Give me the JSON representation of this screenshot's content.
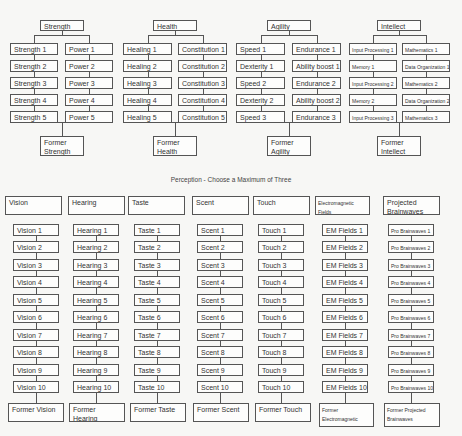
{
  "top_groups": [
    {
      "header": "Strength",
      "col1": [
        "Strength 1",
        "Strength 2",
        "Strength 3",
        "Strength 4",
        "Strength 5"
      ],
      "col2": [
        "Power 1",
        "Power 2",
        "Power 3",
        "Power 4",
        "Power 5"
      ],
      "former": "Former Strength",
      "layout": {
        "hx": 40,
        "hw": 44,
        "c1x": 10,
        "c2x": 65,
        "cw": 48,
        "small1": false,
        "small2": false
      }
    },
    {
      "header": "Health",
      "col1": [
        "Healing 1",
        "Healing 2",
        "Healing 3",
        "Healing 4",
        "Healing 5"
      ],
      "col2": [
        "Constitution 1",
        "Constitution 2",
        "Constitution 3",
        "Constitution 4",
        "Constitution 5"
      ],
      "former": "Former Health",
      "layout": {
        "hx": 153,
        "hw": 44,
        "c1x": 123,
        "c2x": 178,
        "cw": 49,
        "small1": false,
        "small2": false
      }
    },
    {
      "header": "Agility",
      "col1": [
        "Speed 1",
        "Dexterity 1",
        "Speed 2",
        "Dexterity 2",
        "Speed 3"
      ],
      "col2": [
        "Endurance 1",
        "Ability boost 1",
        "Endurance 2",
        "Ability boost 2",
        "Endurance 3"
      ],
      "former": "Former Agility",
      "layout": {
        "hx": 267,
        "hw": 44,
        "c1x": 236,
        "c2x": 292,
        "cw": 49,
        "small1": false,
        "small2": false
      }
    },
    {
      "header": "Intellect",
      "col1": [
        "Input Processing 1",
        "Memory 1",
        "Input Processing 2",
        "Memory 2",
        "Input Processing 3"
      ],
      "col2": [
        "Mathematics 1",
        "Data Organization 1",
        "Mathematics 2",
        "Data Organization 2",
        "Mathematics 3"
      ],
      "former": "Former Intellect",
      "layout": {
        "hx": 377,
        "hw": 44,
        "c1x": 349,
        "c2x": 402,
        "cw": 48,
        "small1": true,
        "small2": true
      }
    }
  ],
  "perception": {
    "title": "Perception - Choose a Maximum of Three",
    "columns": [
      {
        "header": "Vision",
        "items": [
          "Vision 1",
          "Vision 2",
          "Vision 3",
          "Vision 4",
          "Vision 5",
          "Vision 6",
          "Vision 7",
          "Vision 8",
          "Vision 9",
          "Vision 10"
        ],
        "former": "Former Vision",
        "layout": {
          "hx": 5,
          "hw": 57,
          "ix": 13,
          "iw": 46,
          "fx": 8,
          "fw": 56,
          "small": false
        }
      },
      {
        "header": "Hearing",
        "items": [
          "Hearing 1",
          "Hearing 2",
          "Hearing 3",
          "Hearing 4",
          "Hearing 5",
          "Hearing 6",
          "Hearing 7",
          "Hearing 8",
          "Hearing 9",
          "Hearing 10"
        ],
        "former": "Former Hearing",
        "layout": {
          "hx": 68,
          "hw": 57,
          "ix": 73,
          "iw": 46,
          "fx": 69,
          "fw": 56,
          "small": false
        }
      },
      {
        "header": "Taste",
        "items": [
          "Taste 1",
          "Taste 2",
          "Taste 3",
          "Taste 4",
          "Taste 5",
          "Taste 6",
          "Taste 7",
          "Taste 8",
          "Taste 9",
          "Taste 10"
        ],
        "former": "Former Taste",
        "layout": {
          "hx": 128,
          "hw": 57,
          "ix": 134,
          "iw": 46,
          "fx": 130,
          "fw": 56,
          "small": false
        }
      },
      {
        "header": "Scent",
        "items": [
          "Scent 1",
          "Scent 2",
          "Scent 3",
          "Scent 4",
          "Scent 5",
          "Scent 6",
          "Scent 7",
          "Scent 8",
          "Scent 9",
          "Scent 10"
        ],
        "former": "Former Scent",
        "layout": {
          "hx": 192,
          "hw": 57,
          "ix": 197,
          "iw": 46,
          "fx": 193,
          "fw": 56,
          "small": false
        }
      },
      {
        "header": "Touch",
        "items": [
          "Touch 1",
          "Touch 2",
          "Touch 3",
          "Touch 4",
          "Touch 5",
          "Touch 6",
          "Touch 7",
          "Touch 8",
          "Touch 9",
          "Touch 10"
        ],
        "former": "Former Touch",
        "layout": {
          "hx": 253,
          "hw": 57,
          "ix": 258,
          "iw": 46,
          "fx": 255,
          "fw": 56,
          "small": false
        }
      },
      {
        "header": "Electromagnetic Fields",
        "items": [
          "EM Fields 1",
          "EM Fields 2",
          "EM Fields 3",
          "EM Fields 4",
          "EM Fields 5",
          "EM Fields 6",
          "EM Fields 7",
          "EM Fields 8",
          "EM Fields 9",
          "EM Fields 10"
        ],
        "former": "Former Electromagnetic Fields",
        "layout": {
          "hx": 315,
          "hw": 55,
          "ix": 322,
          "iw": 46,
          "fx": 319,
          "fw": 55,
          "small": false,
          "headerSmall": true
        }
      },
      {
        "header": "Projected Brainwaves",
        "items": [
          "Pro Brainwaves 1",
          "Pro Brainwaves 2",
          "Pro Brainwaves 3",
          "Pro Brainwaves 4",
          "Pro Brainwaves 5",
          "Pro Brainwaves 6",
          "Pro Brainwaves 7",
          "Pro Brainwaves 8",
          "Pro Brainwaves 9",
          "Pro Brainwaves 10"
        ],
        "former": "Former Projected Brainwaves",
        "layout": {
          "hx": 383,
          "hw": 57,
          "ix": 388,
          "iw": 46,
          "fx": 384,
          "fw": 56,
          "small": true
        }
      }
    ]
  }
}
